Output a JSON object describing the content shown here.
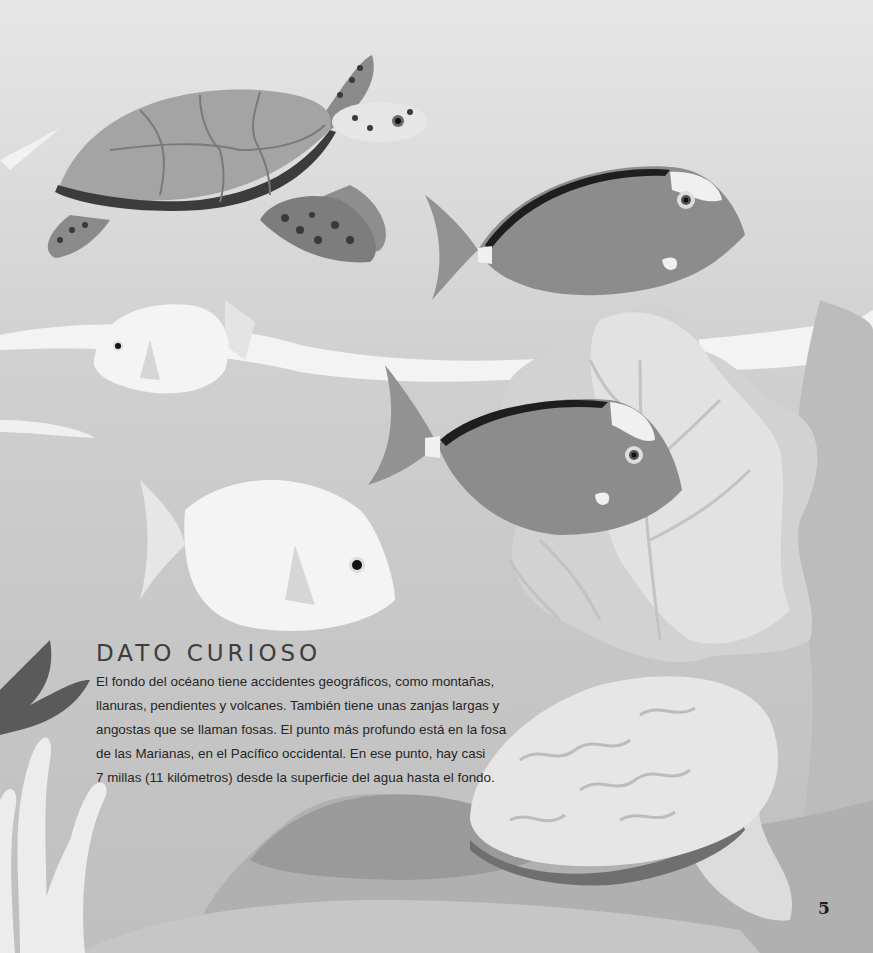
{
  "fact_box": {
    "title": "DATO CURIOSO",
    "lines": [
      "El fondo del océano tiene accidentes geográficos, como montañas,",
      "llanuras, pendientes y volcanes. También tiene unas zanjas largas y",
      "angostas que se llaman fosas. El punto más profundo está en la fosa",
      "de las Marianas, en el Pacífico occidental. En ese punto, hay casi",
      "7 millas (11 kilómetros) desde la superficie del agua hasta el fondo."
    ]
  },
  "page_number": "5",
  "illustration": {
    "elements": [
      "sea-turtle",
      "surgeonfish",
      "white-fish",
      "surgeonfish",
      "white-fish",
      "sea-fan-coral",
      "branching-coral",
      "clam-shell",
      "seafloor-rocks"
    ],
    "colors": {
      "water_top": "#e6e6e6",
      "water_bottom": "#bfbfbf",
      "fish_body": "#8c8c8c",
      "turtle_shell": "#a4a4a4",
      "turtle_rim": "#3c3c3c",
      "white_fish": "#f2f2f2",
      "coral_light": "#dedede",
      "rock_dark": "#9a9a9a"
    }
  }
}
